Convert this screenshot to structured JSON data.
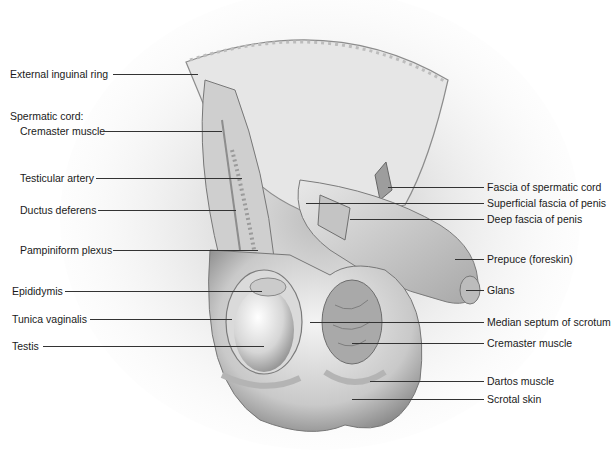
{
  "figure": {
    "colors": {
      "background": "#ffffff",
      "label_text": "#1a1a1a",
      "leader_line": "#333333",
      "tissue_light": "#ececec",
      "tissue_mid": "#b8b8b8",
      "tissue_dark": "#6e6e6e"
    },
    "left_labels": [
      {
        "text": "External inguinal ring",
        "x": 10,
        "y": 74,
        "line_x1": 113,
        "line_x2": 198
      },
      {
        "text": "Spermatic cord:",
        "x": 10,
        "y": 116,
        "line_x1": null,
        "line_x2": null
      },
      {
        "text": "Cremaster muscle",
        "x": 20,
        "y": 126,
        "line_x1": 104,
        "line_x2": 222
      },
      {
        "text": "Testicular artery",
        "x": 20,
        "y": 173,
        "line_x1": 96,
        "line_x2": 242
      },
      {
        "text": "Ductus deferens",
        "x": 20,
        "y": 205,
        "line_x1": 98,
        "line_x2": 236
      },
      {
        "text": "Pampiniform plexus",
        "x": 20,
        "y": 244,
        "line_x1": 113,
        "line_x2": 258
      },
      {
        "text": "Epididymis",
        "x": 12,
        "y": 285,
        "line_x1": 65,
        "line_x2": 262
      },
      {
        "text": "Tunica vaginalis",
        "x": 12,
        "y": 314,
        "line_x1": 90,
        "line_x2": 232
      },
      {
        "text": "Testis",
        "x": 12,
        "y": 341,
        "line_x1": 43,
        "line_x2": 264
      }
    ],
    "right_labels": [
      {
        "text": "Fascia of spermatic cord",
        "x": 487,
        "y": 180,
        "line_x1": 388,
        "line_x2": 484
      },
      {
        "text": "Superficial fascia of penis",
        "x": 487,
        "y": 197,
        "line_x1": 306,
        "line_x2": 484
      },
      {
        "text": "Deep fascia of penis",
        "x": 487,
        "y": 213,
        "line_x1": 350,
        "line_x2": 484
      },
      {
        "text": "Prepuce (foreskin)",
        "x": 487,
        "y": 253,
        "line_x1": 455,
        "line_x2": 484
      },
      {
        "text": "Glans",
        "x": 487,
        "y": 284,
        "line_x1": 466,
        "line_x2": 484
      },
      {
        "text": "Median septum of scrotum",
        "x": 487,
        "y": 316,
        "line_x1": 310,
        "line_x2": 484
      },
      {
        "text": "Cremaster muscle",
        "x": 487,
        "y": 337,
        "line_x1": 352,
        "line_x2": 484
      },
      {
        "text": "Dartos muscle",
        "x": 487,
        "y": 375,
        "line_x1": 370,
        "line_x2": 484
      },
      {
        "text": "Scrotal skin",
        "x": 487,
        "y": 394,
        "line_x1": 352,
        "line_x2": 484
      }
    ]
  }
}
